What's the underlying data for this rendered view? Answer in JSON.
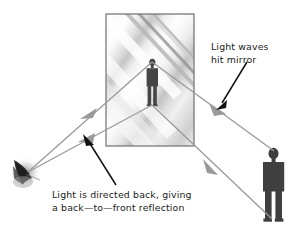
{
  "figure": {
    "background_color": "#ffffff"
  },
  "labels": {
    "mirror": {
      "name": "light-waves-hit-mirror-label",
      "line1": "Light waves",
      "line2": "hit mirror"
    },
    "reflection": {
      "name": "light-directed-back-label",
      "line1": "Light is directed back, giving",
      "line2": "a back—to—front reflection"
    }
  },
  "colors": {
    "ray": "#9a9a9a",
    "arrow_pointer": "#111111",
    "figure": "#454545",
    "mirror_frame": "#6e6e6e",
    "mirror_light": "#ffffff",
    "mirror_shade": "#a8a8a8",
    "text": "#1a1a1a",
    "candle": "#2b2b2b"
  },
  "objects": {
    "mirror": {
      "name": "mirror-panel",
      "x": 106,
      "y": 14,
      "width": 88,
      "height": 132
    },
    "mirror_person": {
      "name": "reflected-person-silhouette",
      "x": 146,
      "y": 59,
      "width": 13,
      "height": 47
    },
    "viewer_person": {
      "name": "viewer-person-silhouette",
      "x": 262,
      "y": 148,
      "width": 26,
      "height": 74
    },
    "candle": {
      "name": "candle-flame-object",
      "x": 10,
      "y": 155,
      "width": 30,
      "height": 32
    }
  },
  "rays": {
    "name": "light-ray-paths",
    "incoming_upper": {
      "name": "ray-candle-to-mirror-head",
      "from_x": 28,
      "from_y": 172,
      "to_x": 152,
      "to_y": 62
    },
    "incoming_lower": {
      "name": "ray-candle-to-mirror-feet",
      "from_x": 28,
      "from_y": 172,
      "to_x": 152,
      "to_y": 105
    },
    "outgoing_upper": {
      "name": "ray-mirror-head-to-viewer",
      "from_x": 152,
      "from_y": 62,
      "to_x": 272,
      "to_y": 150
    },
    "outgoing_lower": {
      "name": "ray-mirror-feet-to-viewer",
      "from_x": 152,
      "from_y": 105,
      "to_x": 272,
      "to_y": 218
    },
    "arrow_reflect_upper": {
      "name": "ray-arrowhead-upper-left",
      "x": 88,
      "y": 113
    },
    "arrow_reflect_lower": {
      "name": "ray-arrowhead-lower-left",
      "x": 86,
      "y": 139
    },
    "arrow_incoming_right": {
      "name": "ray-arrowhead-upper-right",
      "x": 219,
      "y": 110
    },
    "arrow_incoming_lower_right": {
      "name": "ray-arrowhead-lower-right",
      "x": 212,
      "y": 166
    }
  },
  "pointers": {
    "mirror_pointer": {
      "name": "mirror-label-pointer-arrow",
      "from_x": 245,
      "from_y": 64,
      "to_x": 219,
      "to_y": 108
    },
    "reflection_pointer": {
      "name": "reflection-label-pointer-arrow",
      "from_x": 115,
      "from_y": 185,
      "to_x": 85,
      "to_y": 141
    }
  }
}
